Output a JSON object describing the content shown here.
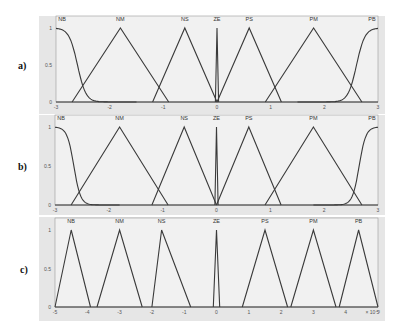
{
  "figure": {
    "panels": [
      {
        "id": "a",
        "label": "a)"
      },
      {
        "id": "b",
        "label": "b)"
      },
      {
        "id": "c",
        "label": "c)"
      }
    ]
  },
  "chart_data": [
    {
      "type": "line",
      "title": "a) Membership functions",
      "xlabel": "",
      "ylabel": "",
      "xlim": [
        -3,
        3
      ],
      "ylim": [
        0,
        1
      ],
      "x_ticks": [
        "-3",
        "-2",
        "-1",
        "0",
        "1",
        "2",
        "3"
      ],
      "y_ticks": [
        "0",
        "0.5",
        "1"
      ],
      "grid": false,
      "series": [
        {
          "name": "NB",
          "shape": "z-sigmoid",
          "points": [
            [
              -3,
              1
            ],
            [
              -2.75,
              0.9
            ],
            [
              -2.6,
              0.5
            ],
            [
              -2.2,
              0.05
            ],
            [
              -1.5,
              0
            ]
          ]
        },
        {
          "name": "NM",
          "shape": "triangle",
          "points": [
            [
              -2.7,
              0
            ],
            [
              -1.8,
              1
            ],
            [
              -0.9,
              0
            ]
          ]
        },
        {
          "name": "NS",
          "shape": "triangle",
          "points": [
            [
              -1.2,
              0
            ],
            [
              -0.6,
              1
            ],
            [
              0,
              0
            ]
          ]
        },
        {
          "name": "ZE",
          "shape": "triangle",
          "points": [
            [
              -0.03,
              0
            ],
            [
              0,
              1
            ],
            [
              0.03,
              0
            ]
          ]
        },
        {
          "name": "PS",
          "shape": "triangle",
          "points": [
            [
              0,
              0
            ],
            [
              0.6,
              1
            ],
            [
              1.2,
              0
            ]
          ]
        },
        {
          "name": "PM",
          "shape": "triangle",
          "points": [
            [
              0.9,
              0
            ],
            [
              1.8,
              1
            ],
            [
              2.7,
              0
            ]
          ]
        },
        {
          "name": "PB",
          "shape": "s-sigmoid",
          "points": [
            [
              1.5,
              0
            ],
            [
              2.2,
              0.05
            ],
            [
              2.6,
              0.5
            ],
            [
              2.75,
              0.9
            ],
            [
              3,
              1
            ]
          ]
        }
      ]
    },
    {
      "type": "line",
      "title": "b) Membership functions",
      "xlabel": "",
      "ylabel": "",
      "xlim": [
        -3,
        3
      ],
      "ylim": [
        0,
        1
      ],
      "x_ticks": [
        "-3",
        "-2",
        "-1",
        "0",
        "1",
        "2",
        "3"
      ],
      "y_ticks": [
        "0",
        "0.5",
        "1"
      ],
      "grid": false,
      "series": [
        {
          "name": "NB",
          "shape": "z-sigmoid",
          "points": [
            [
              -3,
              1
            ],
            [
              -2.8,
              0.9
            ],
            [
              -2.65,
              0.5
            ],
            [
              -2.35,
              0.05
            ],
            [
              -1.8,
              0
            ]
          ]
        },
        {
          "name": "NM",
          "shape": "triangle",
          "points": [
            [
              -2.7,
              0
            ],
            [
              -1.8,
              1
            ],
            [
              -0.9,
              0
            ]
          ]
        },
        {
          "name": "NS",
          "shape": "triangle",
          "points": [
            [
              -1.2,
              0
            ],
            [
              -0.6,
              1
            ],
            [
              0,
              0
            ]
          ]
        },
        {
          "name": "ZE",
          "shape": "triangle",
          "points": [
            [
              -0.03,
              0
            ],
            [
              0,
              1
            ],
            [
              0.03,
              0
            ]
          ]
        },
        {
          "name": "PS",
          "shape": "triangle",
          "points": [
            [
              0,
              0
            ],
            [
              0.6,
              1
            ],
            [
              1.2,
              0
            ]
          ]
        },
        {
          "name": "PM",
          "shape": "triangle",
          "points": [
            [
              0.9,
              0
            ],
            [
              1.8,
              1
            ],
            [
              2.7,
              0
            ]
          ]
        },
        {
          "name": "PB",
          "shape": "s-sigmoid",
          "points": [
            [
              1.8,
              0
            ],
            [
              2.35,
              0.05
            ],
            [
              2.65,
              0.5
            ],
            [
              2.8,
              0.9
            ],
            [
              3,
              1
            ]
          ]
        }
      ]
    },
    {
      "type": "line",
      "title": "c) Membership functions",
      "xlabel": "",
      "ylabel": "",
      "xlim": [
        -5,
        5
      ],
      "x_scale_note": "x 10^-3",
      "ylim": [
        0,
        1
      ],
      "x_ticks": [
        "-5",
        "-4",
        "-3",
        "-2",
        "-1",
        "0",
        "1",
        "2",
        "3",
        "4",
        "5"
      ],
      "y_ticks": [
        "0",
        "0.5",
        "1"
      ],
      "grid": false,
      "series": [
        {
          "name": "NB",
          "shape": "triangle",
          "points": [
            [
              -5,
              0
            ],
            [
              -4.5,
              1
            ],
            [
              -3.9,
              0
            ]
          ]
        },
        {
          "name": "NM",
          "shape": "triangle",
          "points": [
            [
              -3.7,
              0
            ],
            [
              -3.0,
              1
            ],
            [
              -2.3,
              0
            ]
          ]
        },
        {
          "name": "NS",
          "shape": "triangle",
          "points": [
            [
              -2.0,
              0
            ],
            [
              -1.7,
              1
            ],
            [
              -0.8,
              0
            ]
          ]
        },
        {
          "name": "ZE",
          "shape": "triangle",
          "points": [
            [
              -0.1,
              0
            ],
            [
              0,
              1
            ],
            [
              0.1,
              0
            ]
          ]
        },
        {
          "name": "PS",
          "shape": "triangle",
          "points": [
            [
              0.8,
              0
            ],
            [
              1.5,
              1
            ],
            [
              2.2,
              0
            ]
          ]
        },
        {
          "name": "PM",
          "shape": "triangle",
          "points": [
            [
              2.3,
              0
            ],
            [
              3.0,
              1
            ],
            [
              3.7,
              0
            ]
          ]
        },
        {
          "name": "PB",
          "shape": "triangle",
          "points": [
            [
              3.8,
              0
            ],
            [
              4.4,
              1
            ],
            [
              5,
              0
            ]
          ]
        }
      ]
    }
  ]
}
